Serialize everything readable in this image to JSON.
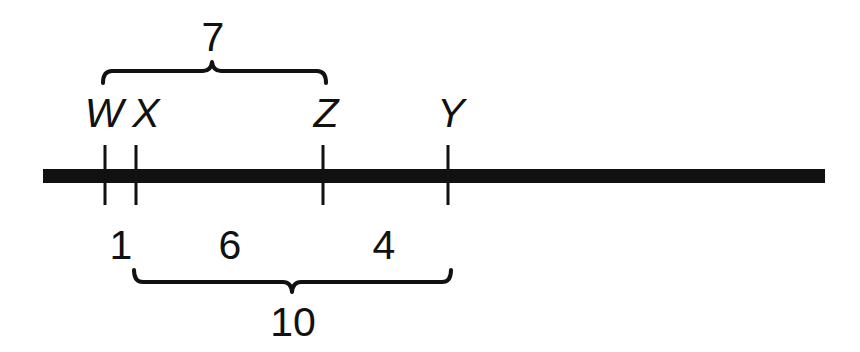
{
  "diagram": {
    "type": "number-line-segment-lengths",
    "line_color": "#111111",
    "points": [
      {
        "label": "W",
        "x": 105
      },
      {
        "label": "X",
        "x": 136
      },
      {
        "label": "Z",
        "x": 323
      },
      {
        "label": "Y",
        "x": 448
      }
    ],
    "segment_lengths": {
      "WX": "1",
      "XZ": "6",
      "ZY": "4"
    },
    "braces": {
      "top": {
        "from": "W",
        "to": "Z",
        "label": "7"
      },
      "bottom": {
        "from": "X",
        "to": "Y",
        "label": "10"
      }
    }
  }
}
